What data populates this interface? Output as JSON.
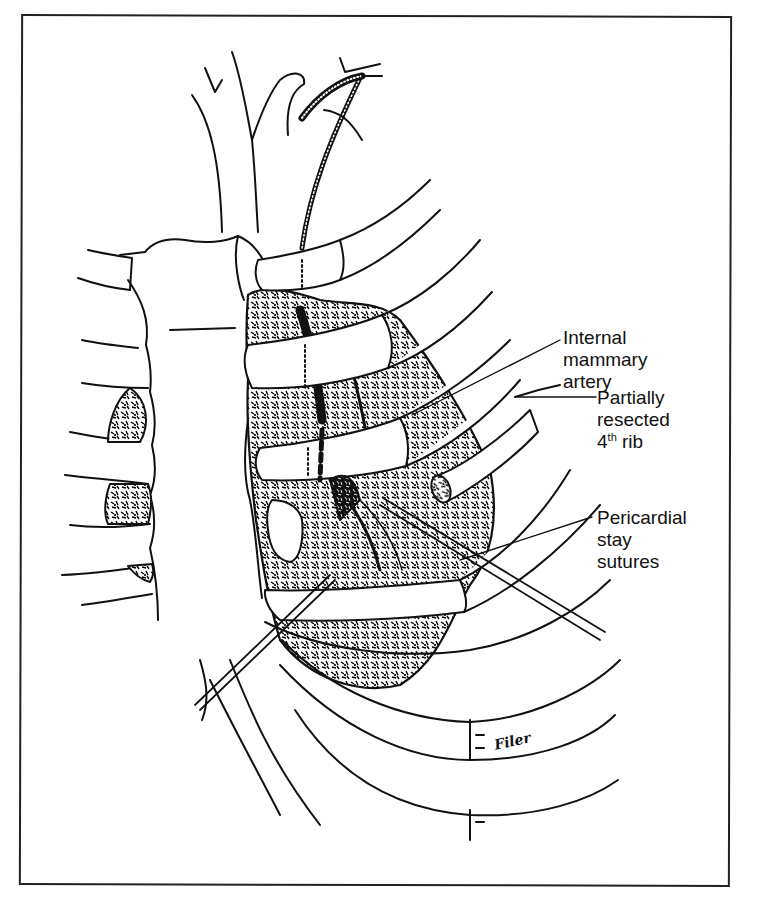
{
  "figure": {
    "type": "surgical line illustration",
    "colors": {
      "ink": "#111111",
      "background": "#ffffff",
      "frame": "#222222"
    }
  },
  "labels": [
    {
      "id": "internal-mammary-artery",
      "lines": [
        "Internal",
        "mammary",
        "artery"
      ]
    },
    {
      "id": "partially-resected-rib",
      "lines": [
        "Partially",
        "resected"
      ],
      "rib_number": "4",
      "rib_suffix": "th",
      "rib_word": "rib"
    },
    {
      "id": "pericardial-stay-sutures",
      "lines": [
        "Pericardial",
        "stay",
        "sutures"
      ]
    }
  ],
  "signature": "Filer"
}
